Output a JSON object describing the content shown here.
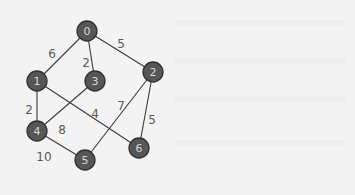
{
  "graph": {
    "type": "undirected-weighted",
    "colors": {
      "background": "#f3f3f3",
      "node_fill": "#565656",
      "node_stroke": "#303030",
      "node_text": "#d8d8d8",
      "edge": "#3a3a3a",
      "edge_label": "#5a5a5a"
    },
    "nodes": [
      {
        "id": "0",
        "label": "0",
        "x": 87,
        "y": 31
      },
      {
        "id": "1",
        "label": "1",
        "x": 37,
        "y": 81
      },
      {
        "id": "2",
        "label": "2",
        "x": 153,
        "y": 72
      },
      {
        "id": "3",
        "label": "3",
        "x": 95,
        "y": 81
      },
      {
        "id": "4",
        "label": "4",
        "x": 37,
        "y": 131
      },
      {
        "id": "5",
        "label": "5",
        "x": 85,
        "y": 160
      },
      {
        "id": "6",
        "label": "6",
        "x": 139,
        "y": 148
      }
    ],
    "edges": [
      {
        "from": "0",
        "to": "1",
        "weight": "6",
        "lx": 52,
        "ly": 54
      },
      {
        "from": "0",
        "to": "3",
        "weight": "2",
        "lx": 86,
        "ly": 63
      },
      {
        "from": "0",
        "to": "2",
        "weight": "5",
        "lx": 121,
        "ly": 44
      },
      {
        "from": "1",
        "to": "4",
        "weight": "2",
        "lx": 29,
        "ly": 110
      },
      {
        "from": "1",
        "to": "6",
        "weight": "4",
        "lx": 95,
        "ly": 114
      },
      {
        "from": "3",
        "to": "4",
        "weight": "8",
        "lx": 62,
        "ly": 130
      },
      {
        "from": "2",
        "to": "5",
        "weight": "7",
        "lx": 121,
        "ly": 106
      },
      {
        "from": "2",
        "to": "6",
        "weight": "5",
        "lx": 152,
        "ly": 120
      },
      {
        "from": "4",
        "to": "5",
        "weight": "10",
        "lx": 44,
        "ly": 157
      }
    ],
    "node_radius": 10
  }
}
